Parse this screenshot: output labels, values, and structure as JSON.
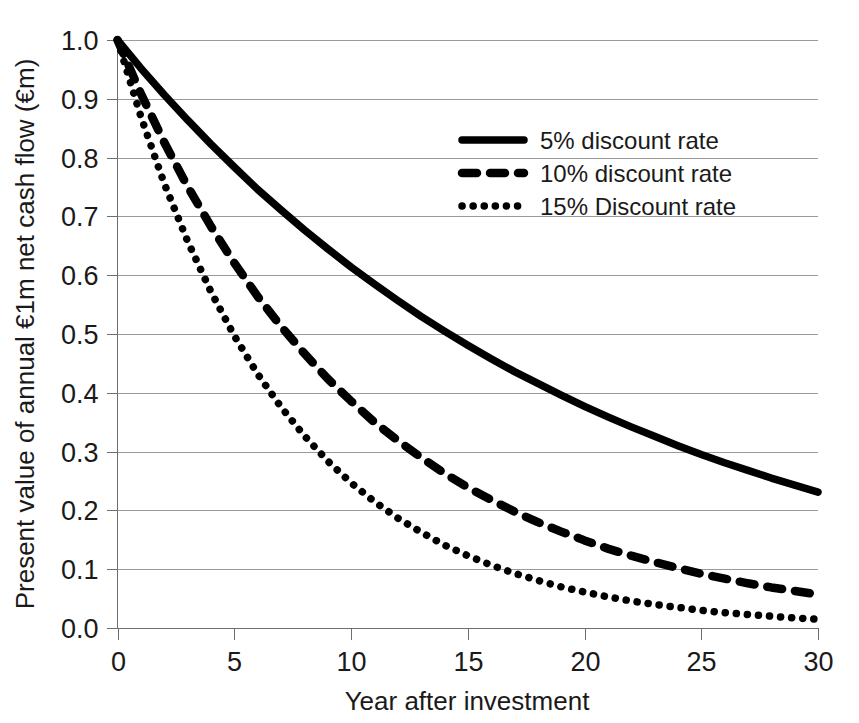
{
  "chart_data": {
    "type": "line",
    "title": "",
    "xlabel": "Year after investment",
    "ylabel": "Present value of annual €1m net cash flow (€m)",
    "xlim": [
      0,
      30
    ],
    "ylim": [
      0.0,
      1.0
    ],
    "grid": true,
    "legend_position": "upper-right-inside",
    "xticks": [
      "0",
      "5",
      "10",
      "15",
      "20",
      "25",
      "30"
    ],
    "xtick_values": [
      0,
      5,
      10,
      15,
      20,
      25,
      30
    ],
    "yticks": [
      "0.0",
      "0.1",
      "0.2",
      "0.3",
      "0.4",
      "0.5",
      "0.6",
      "0.7",
      "0.8",
      "0.9",
      "1.0"
    ],
    "ytick_values": [
      0.0,
      0.1,
      0.2,
      0.3,
      0.4,
      0.5,
      0.6,
      0.7,
      0.8,
      0.9,
      1.0
    ],
    "x": [
      0,
      1,
      2,
      3,
      4,
      5,
      6,
      7,
      8,
      9,
      10,
      11,
      12,
      13,
      14,
      15,
      16,
      17,
      18,
      19,
      20,
      21,
      22,
      23,
      24,
      25,
      26,
      27,
      28,
      29,
      30
    ],
    "series": [
      {
        "name": "5% discount rate",
        "rate": 0.05,
        "style": "solid",
        "color": "#000000",
        "values": [
          1.0,
          0.952,
          0.907,
          0.864,
          0.823,
          0.784,
          0.746,
          0.711,
          0.677,
          0.645,
          0.614,
          0.585,
          0.557,
          0.53,
          0.505,
          0.481,
          0.458,
          0.436,
          0.416,
          0.396,
          0.377,
          0.359,
          0.342,
          0.326,
          0.31,
          0.295,
          0.281,
          0.268,
          0.255,
          0.243,
          0.231
        ]
      },
      {
        "name": "10% discount rate",
        "rate": 0.1,
        "style": "dashed",
        "color": "#000000",
        "values": [
          1.0,
          0.909,
          0.826,
          0.751,
          0.683,
          0.621,
          0.564,
          0.513,
          0.467,
          0.424,
          0.386,
          0.35,
          0.319,
          0.29,
          0.263,
          0.239,
          0.218,
          0.198,
          0.18,
          0.164,
          0.149,
          0.135,
          0.123,
          0.112,
          0.102,
          0.092,
          0.084,
          0.076,
          0.069,
          0.063,
          0.057
        ]
      },
      {
        "name": "15% Discount rate",
        "rate": 0.15,
        "style": "dotted",
        "color": "#000000",
        "values": [
          1.0,
          0.87,
          0.756,
          0.658,
          0.572,
          0.497,
          0.432,
          0.376,
          0.327,
          0.284,
          0.247,
          0.215,
          0.187,
          0.163,
          0.141,
          0.123,
          0.107,
          0.093,
          0.081,
          0.07,
          0.061,
          0.053,
          0.046,
          0.04,
          0.035,
          0.03,
          0.026,
          0.023,
          0.02,
          0.017,
          0.015
        ]
      }
    ]
  },
  "legend": {
    "entries": [
      {
        "label": "5% discount rate",
        "style": "solid"
      },
      {
        "label": "10% discount rate",
        "style": "dashed"
      },
      {
        "label": "15% Discount rate",
        "style": "dotted"
      }
    ]
  },
  "colors": {
    "series": "#000000",
    "gridline": "#9a9a9a",
    "axis": "#6e6e6e",
    "background": "#ffffff",
    "text": "#1a1a1a"
  }
}
